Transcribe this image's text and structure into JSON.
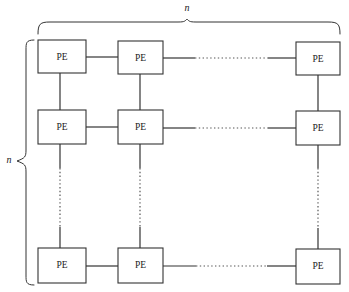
{
  "figure": {
    "node_label": "PE",
    "top_brace_label": "n",
    "left_brace_label": "n",
    "background_color": "#ffffff",
    "line_color": "#333333",
    "dotted_line_color": "#555555",
    "text_color": "#1a1a1a"
  },
  "grid": {
    "rows": 3,
    "cols": 3,
    "row_y": [
      40,
      110,
      248
    ],
    "row_h": [
      33,
      34,
      35
    ],
    "col_x": [
      38,
      118,
      296
    ],
    "col_w": [
      48,
      45,
      44
    ],
    "nodes": [
      [
        {
          "id": "pe-r1c1",
          "label": "PE",
          "x": 38,
          "y": 40,
          "w": 48,
          "h": 33
        },
        {
          "id": "pe-r1c2",
          "label": "PE",
          "x": 118,
          "y": 41,
          "w": 45,
          "h": 33
        },
        {
          "id": "pe-r1c3",
          "label": "PE",
          "x": 296,
          "y": 42,
          "w": 44,
          "h": 33
        }
      ],
      [
        {
          "id": "pe-r2c1",
          "label": "PE",
          "x": 38,
          "y": 110,
          "w": 48,
          "h": 34
        },
        {
          "id": "pe-r2c2",
          "label": "PE",
          "x": 118,
          "y": 110,
          "w": 45,
          "h": 34
        },
        {
          "id": "pe-r2c3",
          "label": "PE",
          "x": 296,
          "y": 111,
          "w": 44,
          "h": 34
        }
      ],
      [
        {
          "id": "pe-r3c1",
          "label": "PE",
          "x": 38,
          "y": 248,
          "w": 48,
          "h": 35
        },
        {
          "id": "pe-r3c2",
          "label": "PE",
          "x": 118,
          "y": 248,
          "w": 45,
          "h": 35
        },
        {
          "id": "pe-r3c3",
          "label": "PE",
          "x": 296,
          "y": 249,
          "w": 44,
          "h": 35
        }
      ]
    ]
  },
  "connections": {
    "horizontal": [
      {
        "id": "h-r1-c1c2",
        "style": "solid",
        "x1": 86,
        "x2": 118,
        "y": 57
      },
      {
        "id": "h-r1-c2c3",
        "style": "solid-dotted-solid",
        "x1": 163,
        "x2": 296,
        "y": 58
      },
      {
        "id": "h-r2-c1c2",
        "style": "solid",
        "x1": 86,
        "x2": 118,
        "y": 127
      },
      {
        "id": "h-r2-c2c3",
        "style": "solid-dotted-solid",
        "x1": 163,
        "x2": 296,
        "y": 128
      },
      {
        "id": "h-r3-c1c2",
        "style": "solid",
        "x1": 86,
        "x2": 118,
        "y": 266
      },
      {
        "id": "h-r3-c2c3",
        "style": "solid-dotted-solid",
        "x1": 163,
        "x2": 296,
        "y": 266
      }
    ],
    "vertical": [
      {
        "id": "v-c1-r1r2",
        "style": "solid",
        "x": 60,
        "y1": 73,
        "y2": 110
      },
      {
        "id": "v-c2-r1r2",
        "style": "solid",
        "x": 140,
        "y1": 74,
        "y2": 110
      },
      {
        "id": "v-c3-r1r2",
        "style": "solid",
        "x": 318,
        "y1": 75,
        "y2": 111
      },
      {
        "id": "v-c1-r2r3",
        "style": "solid-dotted-solid",
        "x": 60,
        "y1": 144,
        "y2": 248
      },
      {
        "id": "v-c2-r2r3",
        "style": "solid-dotted-solid",
        "x": 140,
        "y1": 144,
        "y2": 248
      },
      {
        "id": "v-c3-r2r3",
        "style": "solid-dotted-solid",
        "x": 318,
        "y1": 145,
        "y2": 249
      }
    ]
  },
  "braces": {
    "top": {
      "id": "top-brace",
      "label": "n",
      "label_x": 187,
      "label_y": 9,
      "start_x": 38,
      "end_x": 340,
      "apex_x": 187,
      "base_y": 34,
      "apex_y": 19
    },
    "left": {
      "id": "left-brace",
      "label": "n",
      "label_x": 9,
      "label_y": 161,
      "start_y": 40,
      "end_y": 285,
      "apex_y": 161,
      "base_x": 26,
      "apex_x": 17
    }
  }
}
